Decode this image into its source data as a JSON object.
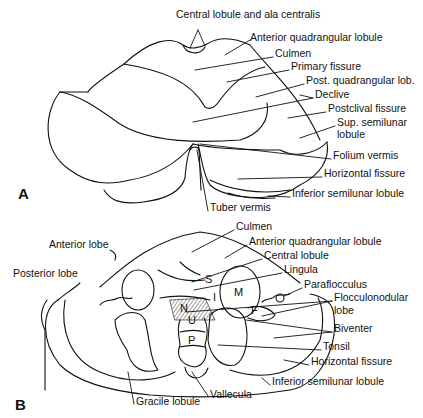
{
  "figure": {
    "panels": [
      {
        "id": "A",
        "label": "A",
        "labels": [
          {
            "text": "Central lobule and ala centralis",
            "x": 176,
            "y": 14
          },
          {
            "text": "Anterior quadrangular lobule",
            "x": 250,
            "y": 37
          },
          {
            "text": "Culmen",
            "x": 275,
            "y": 53
          },
          {
            "text": "Primary fissure",
            "x": 291,
            "y": 66
          },
          {
            "text": "Post. quadrangular lob.",
            "x": 306,
            "y": 80
          },
          {
            "text": "Declive",
            "x": 315,
            "y": 94
          },
          {
            "text": "Postclival fissure",
            "x": 328,
            "y": 108
          },
          {
            "text": "Sup. semilunar",
            "x": 337,
            "y": 122
          },
          {
            "text": "lobule",
            "x": 337,
            "y": 134
          },
          {
            "text": "Folium vermis",
            "x": 333,
            "y": 155
          },
          {
            "text": "Horizontal fissure",
            "x": 324,
            "y": 173
          },
          {
            "text": "Inferior semilunar lobule",
            "x": 292,
            "y": 193
          },
          {
            "text": "Tuber vermis",
            "x": 210,
            "y": 207
          }
        ]
      },
      {
        "id": "B",
        "label": "B",
        "labels": [
          {
            "text": "Culmen",
            "x": 236,
            "y": 226
          },
          {
            "text": "Anterior quadrangular lobule",
            "x": 249,
            "y": 241
          },
          {
            "text": "Central lobule",
            "x": 264,
            "y": 255
          },
          {
            "text": "Lingula",
            "x": 284,
            "y": 269
          },
          {
            "text": "Paraflocculus",
            "x": 304,
            "y": 284
          },
          {
            "text": "Flocculonodular",
            "x": 334,
            "y": 297
          },
          {
            "text": "lobe",
            "x": 334,
            "y": 310
          },
          {
            "text": "Anterior lobe",
            "x": 49,
            "y": 244
          },
          {
            "text": "Posterior lobe",
            "x": 13,
            "y": 273
          },
          {
            "text": "Biventer",
            "x": 334,
            "y": 328
          },
          {
            "text": "Tonsil",
            "x": 323,
            "y": 346
          },
          {
            "text": "Horizontal fissure",
            "x": 311,
            "y": 361
          },
          {
            "text": "Inferior semilunar lobule",
            "x": 272,
            "y": 381
          },
          {
            "text": "Vallecula",
            "x": 210,
            "y": 394
          },
          {
            "text": "Gracile lobule",
            "x": 136,
            "y": 401
          }
        ],
        "letters": [
          {
            "text": "S",
            "x": 205,
            "y": 279
          },
          {
            "text": "I",
            "x": 213,
            "y": 297
          },
          {
            "text": "M",
            "x": 234,
            "y": 292
          },
          {
            "text": "N",
            "x": 180,
            "y": 308
          },
          {
            "text": "F",
            "x": 251,
            "y": 310
          },
          {
            "text": "U",
            "x": 188,
            "y": 320
          },
          {
            "text": "P",
            "x": 188,
            "y": 340
          }
        ]
      }
    ]
  }
}
